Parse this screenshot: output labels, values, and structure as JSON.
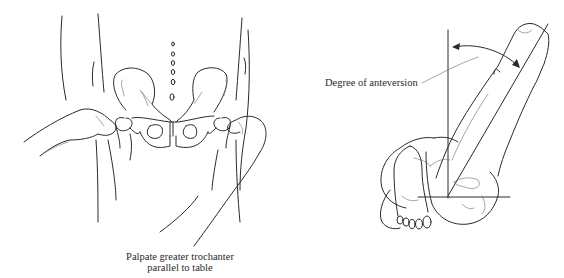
{
  "figure": {
    "left_panel": {
      "subject": "pelvis with hands palpating greater trochanters",
      "caption_line1": "Palpate greater trochanter",
      "caption_line2": "parallel to table"
    },
    "right_panel": {
      "subject": "prone patient, knee flexed 90°, leg rotated to measure hip anteversion",
      "label": "Degree of anteversion"
    },
    "colors": {
      "line": "#2a2a2a",
      "background": "#ffffff"
    }
  }
}
